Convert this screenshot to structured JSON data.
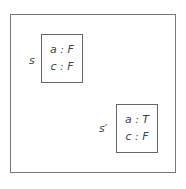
{
  "diagram": {
    "states": [
      {
        "name": "s",
        "vars": [
          "a : F",
          "c : F"
        ]
      },
      {
        "name": "s′",
        "vars": [
          "a : T",
          "c : F"
        ]
      }
    ]
  }
}
